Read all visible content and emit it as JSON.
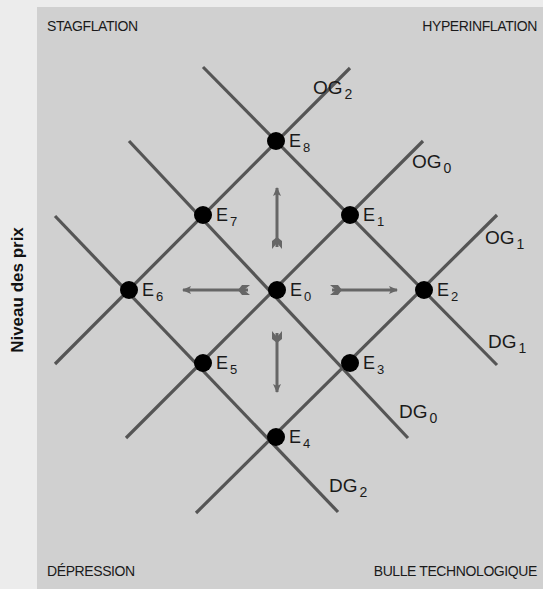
{
  "diagram": {
    "y_axis_label": "Niveau des prix",
    "quadrants": {
      "top_left": "STAGFLATION",
      "top_right": "HYPERINFLATION",
      "bottom_left": "DÉPRESSION",
      "bottom_right": "BULLE TECHNOLOGIQUE"
    },
    "colors": {
      "background": "#ececec",
      "panel": "#d0d0d0",
      "line": "#555555",
      "arrow": "#666666",
      "point": "#000000",
      "text": "#1a1a1a"
    },
    "curves": [
      {
        "id": "OG2",
        "main": "OG",
        "sub": "2",
        "type": "supply",
        "x1": 55,
        "y1": 364,
        "x2": 350,
        "y2": 68,
        "lx": 313,
        "ly": 94
      },
      {
        "id": "OG0",
        "main": "OG",
        "sub": "0",
        "type": "supply",
        "x1": 126,
        "y1": 438,
        "x2": 423,
        "y2": 141,
        "lx": 412,
        "ly": 168
      },
      {
        "id": "OG1",
        "main": "OG",
        "sub": "1",
        "type": "supply",
        "x1": 196,
        "y1": 513,
        "x2": 497,
        "y2": 215,
        "lx": 485,
        "ly": 244
      },
      {
        "id": "DG1",
        "main": "DG",
        "sub": "1",
        "type": "demand",
        "x1": 203,
        "y1": 67,
        "x2": 497,
        "y2": 365,
        "lx": 488,
        "ly": 348
      },
      {
        "id": "DG0",
        "main": "DG",
        "sub": "0",
        "type": "demand",
        "x1": 129,
        "y1": 141,
        "x2": 408,
        "y2": 438,
        "lx": 399,
        "ly": 418
      },
      {
        "id": "DG2",
        "main": "DG",
        "sub": "2",
        "type": "demand",
        "x1": 55,
        "y1": 216,
        "x2": 338,
        "y2": 512,
        "lx": 329,
        "ly": 492
      }
    ],
    "points": [
      {
        "id": "E0",
        "main": "E",
        "sub": "0",
        "x": 277,
        "y": 290
      },
      {
        "id": "E1",
        "main": "E",
        "sub": "1",
        "x": 350,
        "y": 215
      },
      {
        "id": "E2",
        "main": "E",
        "sub": "2",
        "x": 424,
        "y": 290
      },
      {
        "id": "E3",
        "main": "E",
        "sub": "3",
        "x": 350,
        "y": 363
      },
      {
        "id": "E4",
        "main": "E",
        "sub": "4",
        "x": 276,
        "y": 437
      },
      {
        "id": "E5",
        "main": "E",
        "sub": "5",
        "x": 203,
        "y": 363
      },
      {
        "id": "E6",
        "main": "E",
        "sub": "6",
        "x": 129,
        "y": 290
      },
      {
        "id": "E7",
        "main": "E",
        "sub": "7",
        "x": 203,
        "y": 215
      },
      {
        "id": "E8",
        "main": "E",
        "sub": "8",
        "x": 276,
        "y": 141
      }
    ],
    "arrows": [
      {
        "direction": "up",
        "x1": 277,
        "y1": 247,
        "x2": 277,
        "y2": 188
      },
      {
        "direction": "down",
        "x1": 277,
        "y1": 333,
        "x2": 277,
        "y2": 392
      },
      {
        "direction": "left",
        "x1": 248,
        "y1": 290,
        "x2": 183,
        "y2": 290
      },
      {
        "direction": "right",
        "x1": 332,
        "y1": 290,
        "x2": 397,
        "y2": 290
      }
    ]
  }
}
